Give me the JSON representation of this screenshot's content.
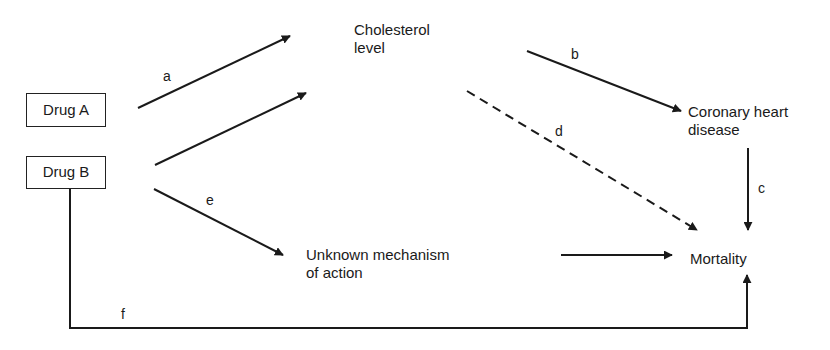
{
  "diagram": {
    "type": "causal-pathway",
    "nodes": [
      {
        "id": "drug_a",
        "label": "Drug A",
        "boxed": true
      },
      {
        "id": "drug_b",
        "label": "Drug B",
        "boxed": true
      },
      {
        "id": "cholesterol",
        "line1": "Cholesterol",
        "line2": "level"
      },
      {
        "id": "chd",
        "line1": "Coronary heart",
        "line2": "disease"
      },
      {
        "id": "unknown",
        "line1": "Unknown mechanism",
        "line2": "of action"
      },
      {
        "id": "mortality",
        "label": "Mortality"
      }
    ],
    "edges": [
      {
        "from": "drug_a",
        "to": "cholesterol",
        "label": "a",
        "style": "solid"
      },
      {
        "from": "drug_b",
        "to": "cholesterol",
        "label": "",
        "style": "solid"
      },
      {
        "from": "cholesterol",
        "to": "chd",
        "label": "b",
        "style": "solid"
      },
      {
        "from": "chd",
        "to": "mortality",
        "label": "c",
        "style": "solid"
      },
      {
        "from": "cholesterol",
        "to": "mortality",
        "label": "d",
        "style": "dashed"
      },
      {
        "from": "drug_b",
        "to": "unknown",
        "label": "e",
        "style": "solid"
      },
      {
        "from": "unknown",
        "to": "mortality",
        "label": "",
        "style": "solid"
      },
      {
        "from": "drug_b",
        "to": "mortality",
        "label": "f",
        "style": "solid"
      }
    ]
  },
  "labels": {
    "a": "a",
    "b": "b",
    "c": "c",
    "d": "d",
    "e": "e",
    "f": "f"
  },
  "colors": {
    "stroke": "#1a1a1a",
    "background": "#ffffff"
  }
}
